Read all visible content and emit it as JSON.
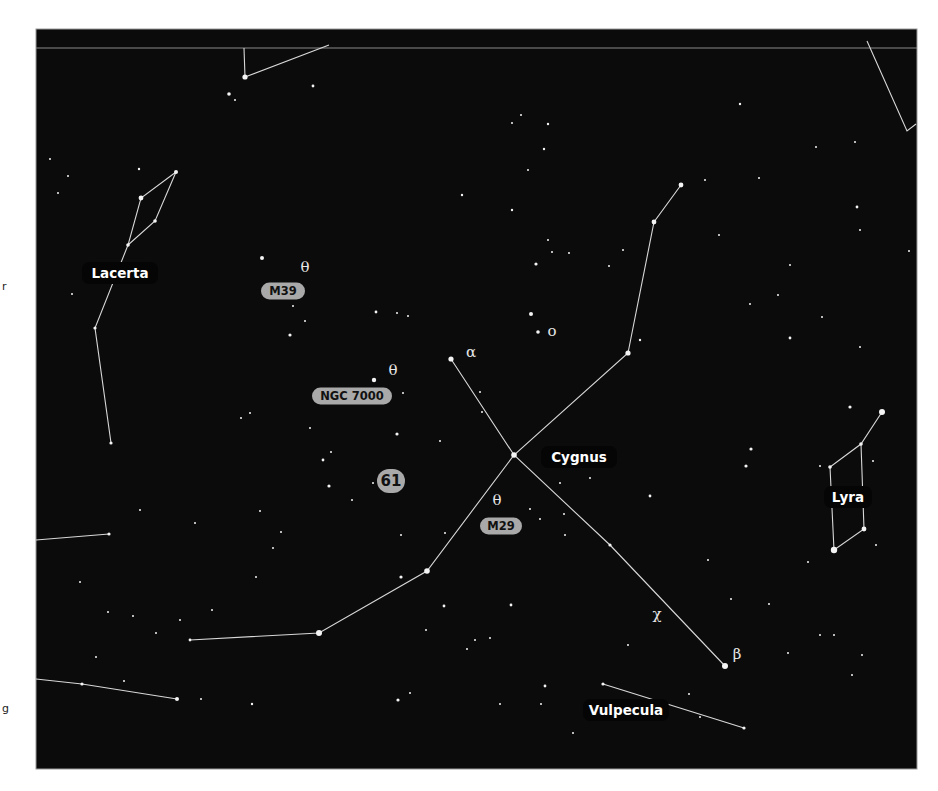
{
  "map": {
    "frame": {
      "x": 36,
      "y": 29,
      "width": 881,
      "height": 740
    },
    "divider_y": 48,
    "colors": {
      "background": "#0b0b0b",
      "lines": "#d8d8d8",
      "stars": "#f4f4f4",
      "object_badge": "#a9a9a9"
    }
  },
  "constellation_labels": [
    {
      "name": "Lacerta",
      "x": 120,
      "y": 273,
      "w": 76
    },
    {
      "name": "Cygnus",
      "x": 579,
      "y": 457,
      "w": 76
    },
    {
      "name": "Lyra",
      "x": 848,
      "y": 497,
      "w": 48
    },
    {
      "name": "Vulpecula",
      "x": 626,
      "y": 710,
      "w": 86
    }
  ],
  "deep_sky_labels": [
    {
      "name": "M39",
      "x": 283,
      "y": 291,
      "w": 44
    },
    {
      "name": "NGC 7000",
      "x": 352,
      "y": 396,
      "w": 80
    },
    {
      "name": "61",
      "x": 391,
      "y": 481,
      "w": 28,
      "round": true
    },
    {
      "name": "M29",
      "x": 501,
      "y": 526,
      "w": 42
    }
  ],
  "greek_labels": [
    {
      "symbol": "θ",
      "x": 305,
      "y": 272
    },
    {
      "symbol": "θ",
      "x": 393,
      "y": 375
    },
    {
      "symbol": "θ",
      "x": 497,
      "y": 505
    },
    {
      "symbol": "α",
      "x": 471,
      "y": 357
    },
    {
      "symbol": "ο",
      "x": 552,
      "y": 336
    },
    {
      "symbol": "χ",
      "x": 657,
      "y": 619
    },
    {
      "symbol": "β",
      "x": 737,
      "y": 659
    }
  ],
  "lines": [
    [
      [
        244,
        48
      ],
      [
        245,
        77
      ],
      [
        329,
        45
      ]
    ],
    [
      [
        867,
        41
      ],
      [
        907,
        131
      ],
      [
        916,
        124
      ]
    ],
    [
      [
        176,
        172
      ],
      [
        141,
        198
      ],
      [
        128,
        245
      ],
      [
        155,
        221
      ],
      [
        176,
        172
      ]
    ],
    [
      [
        128,
        245
      ],
      [
        95,
        328
      ],
      [
        111,
        443
      ]
    ],
    [
      [
        451,
        359
      ],
      [
        514,
        455
      ],
      [
        610,
        545
      ],
      [
        725,
        666
      ]
    ],
    [
      [
        681,
        185
      ],
      [
        654,
        222
      ],
      [
        628,
        353
      ],
      [
        514,
        455
      ],
      [
        427,
        571
      ],
      [
        319,
        633
      ],
      [
        190,
        640
      ]
    ],
    [
      [
        882,
        412
      ],
      [
        861,
        444
      ],
      [
        830,
        467
      ],
      [
        834,
        550
      ],
      [
        864,
        529
      ],
      [
        861,
        444
      ]
    ],
    [
      [
        603,
        684
      ],
      [
        744,
        728
      ]
    ],
    [
      [
        36,
        540
      ],
      [
        109,
        534
      ]
    ],
    [
      [
        36,
        679
      ],
      [
        82,
        684
      ],
      [
        177,
        699
      ]
    ]
  ],
  "stars": [
    [
      245,
      77,
      2.6
    ],
    [
      229,
      94,
      1.8
    ],
    [
      313,
      86,
      1.4
    ],
    [
      235,
      100,
      1
    ],
    [
      139,
      169,
      1.2
    ],
    [
      176,
      172,
      2
    ],
    [
      141,
      198,
      2.4
    ],
    [
      155,
      221,
      1.8
    ],
    [
      128,
      245,
      1.8
    ],
    [
      95,
      328,
      1.6
    ],
    [
      111,
      443,
      1.6
    ],
    [
      50,
      159,
      1
    ],
    [
      68,
      176,
      1
    ],
    [
      58,
      193,
      1
    ],
    [
      72,
      294,
      1
    ],
    [
      262,
      258,
      2
    ],
    [
      290,
      335,
      1.6
    ],
    [
      293,
      306,
      1
    ],
    [
      305,
      321,
      1
    ],
    [
      376,
      312,
      1.4
    ],
    [
      397,
      313,
      1
    ],
    [
      408,
      316,
      1
    ],
    [
      374,
      380,
      2.2
    ],
    [
      397,
      434,
      1.6
    ],
    [
      323,
      460,
      1.4
    ],
    [
      329,
      486,
      1.6
    ],
    [
      250,
      413,
      1
    ],
    [
      241,
      418,
      1
    ],
    [
      331,
      452,
      1
    ],
    [
      512,
      123,
      1
    ],
    [
      521,
      115,
      1
    ],
    [
      544,
      149,
      1.2
    ],
    [
      528,
      170,
      1
    ],
    [
      548,
      124,
      1.2
    ],
    [
      462,
      195,
      1.2
    ],
    [
      512,
      210,
      1.2
    ],
    [
      548,
      240,
      1
    ],
    [
      531,
      314,
      2
    ],
    [
      538,
      332,
      1.8
    ],
    [
      681,
      185,
      2.4
    ],
    [
      654,
      222,
      2.4
    ],
    [
      628,
      353,
      2.6
    ],
    [
      640,
      340,
      1.2
    ],
    [
      623,
      250,
      1
    ],
    [
      609,
      266,
      1
    ],
    [
      552,
      252,
      1
    ],
    [
      569,
      253,
      1
    ],
    [
      536,
      264,
      1.6
    ],
    [
      514,
      455,
      2.8
    ],
    [
      451,
      359,
      2.6
    ],
    [
      610,
      545,
      1.6
    ],
    [
      725,
      666,
      3
    ],
    [
      427,
      571,
      2.8
    ],
    [
      319,
      633,
      3
    ],
    [
      190,
      640,
      1.4
    ],
    [
      109,
      534,
      1.6
    ],
    [
      82,
      684,
      1.6
    ],
    [
      177,
      699,
      2
    ],
    [
      603,
      684,
      1.6
    ],
    [
      744,
      728,
      1.6
    ],
    [
      740,
      104,
      1.2
    ],
    [
      855,
      142,
      1
    ],
    [
      816,
      147,
      1
    ],
    [
      759,
      178,
      1
    ],
    [
      857,
      207,
      1.4
    ],
    [
      860,
      230,
      1
    ],
    [
      909,
      251,
      1
    ],
    [
      860,
      347,
      1
    ],
    [
      790,
      338,
      1.4
    ],
    [
      751,
      449,
      1.6
    ],
    [
      746,
      466,
      1.6
    ],
    [
      850,
      407,
      1.6
    ],
    [
      882,
      412,
      3
    ],
    [
      861,
      444,
      1.8
    ],
    [
      830,
      467,
      1.8
    ],
    [
      864,
      529,
      2.4
    ],
    [
      834,
      550,
      3.2
    ],
    [
      650,
      496,
      1.4
    ],
    [
      590,
      478,
      1
    ],
    [
      530,
      509,
      1
    ],
    [
      540,
      519,
      1
    ],
    [
      564,
      514,
      1
    ],
    [
      560,
      483,
      1
    ],
    [
      565,
      535,
      1
    ],
    [
      511,
      605,
      1.4
    ],
    [
      490,
      638,
      1
    ],
    [
      545,
      686,
      1.4
    ],
    [
      500,
      704,
      1
    ],
    [
      541,
      704,
      1
    ],
    [
      573,
      733,
      1
    ],
    [
      628,
      645,
      1
    ],
    [
      689,
      694,
      1
    ],
    [
      700,
      717,
      1
    ],
    [
      820,
      635,
      1
    ],
    [
      852,
      675,
      1
    ],
    [
      862,
      655,
      1
    ],
    [
      731,
      599,
      1
    ],
    [
      708,
      560,
      1
    ],
    [
      769,
      604,
      1
    ],
    [
      440,
      441,
      1
    ],
    [
      401,
      577,
      1.6
    ],
    [
      445,
      533,
      1
    ],
    [
      444,
      606,
      1.4
    ],
    [
      401,
      535,
      1
    ],
    [
      475,
      640,
      1
    ],
    [
      467,
      649,
      1
    ],
    [
      426,
      630,
      1
    ],
    [
      398,
      700,
      1.6
    ],
    [
      410,
      693,
      1
    ],
    [
      252,
      704,
      1.2
    ],
    [
      180,
      620,
      1
    ],
    [
      156,
      633,
      1
    ],
    [
      212,
      610,
      1
    ],
    [
      201,
      699,
      1
    ],
    [
      140,
      510,
      1
    ],
    [
      108,
      612,
      1
    ],
    [
      133,
      616,
      1
    ],
    [
      80,
      582,
      1
    ],
    [
      96,
      657,
      1
    ],
    [
      124,
      681,
      1
    ],
    [
      273,
      548,
      1
    ],
    [
      256,
      577,
      1
    ],
    [
      195,
      523,
      1
    ],
    [
      281,
      532,
      1
    ],
    [
      373,
      483,
      1
    ],
    [
      260,
      511,
      1
    ],
    [
      352,
      500,
      1
    ],
    [
      403,
      393,
      1
    ],
    [
      310,
      428,
      1
    ],
    [
      480,
      392,
      1
    ],
    [
      482,
      412,
      1
    ],
    [
      790,
      265,
      1
    ],
    [
      705,
      180,
      1
    ],
    [
      719,
      235,
      1
    ],
    [
      822,
      317,
      1
    ],
    [
      778,
      295,
      1
    ],
    [
      750,
      304,
      1
    ],
    [
      820,
      466,
      1
    ],
    [
      873,
      461,
      1
    ],
    [
      876,
      545,
      1
    ],
    [
      808,
      562,
      1
    ],
    [
      834,
      635,
      1
    ],
    [
      788,
      653,
      1
    ]
  ],
  "clipped_edge_text": [
    {
      "text": "r",
      "x": 2,
      "y": 290
    },
    {
      "text": "g",
      "x": 2,
      "y": 712
    }
  ]
}
